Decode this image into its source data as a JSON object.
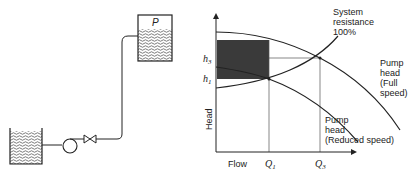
{
  "schematic": {
    "upper_tank_label": "P",
    "components": [
      "supply-tank",
      "pump",
      "valve",
      "pipe",
      "upper-tank"
    ]
  },
  "chart": {
    "y_axis_label": "Head",
    "x_axis_label": "Flow",
    "y_ticks": {
      "h3": "h",
      "h3_sub": "3",
      "h1": "h",
      "h1_sub": "1"
    },
    "x_ticks": {
      "q1": "Q",
      "q1_sub": "1",
      "q3": "Q",
      "q3_sub": "3"
    },
    "system_label": [
      "System",
      "resistance",
      "100%"
    ],
    "full_label": [
      "Pump",
      "head",
      "(Full",
      "speed)"
    ],
    "reduced_label": [
      "Pump",
      "head",
      "(Reduced speed)"
    ]
  },
  "colors": {
    "line": "#222222",
    "shade": "#3a3a3a",
    "grid": "#555555"
  }
}
